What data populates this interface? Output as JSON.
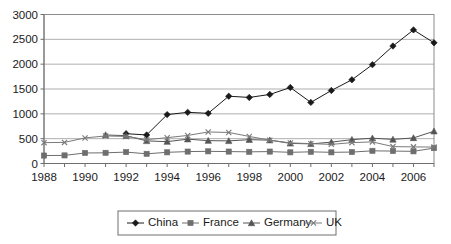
{
  "chart_data": {
    "type": "line",
    "title": "",
    "xlabel": "",
    "ylabel": "",
    "x": [
      1988,
      1989,
      1990,
      1991,
      1992,
      1993,
      1994,
      1995,
      1996,
      1997,
      1998,
      1999,
      2000,
      2001,
      2002,
      2003,
      2004,
      2005,
      2006,
      2007
    ],
    "xtick_labels": [
      "1988",
      "1990",
      "1992",
      "1994",
      "1996",
      "1998",
      "2000",
      "2002",
      "2004",
      "2006"
    ],
    "xticks": [
      1988,
      1990,
      1992,
      1994,
      1996,
      1998,
      2000,
      2002,
      2004,
      2006
    ],
    "ytick_labels": [
      "0",
      "500",
      "1000",
      "1500",
      "2000",
      "2500",
      "3000"
    ],
    "yticks": [
      0,
      500,
      1000,
      1500,
      2000,
      2500,
      3000
    ],
    "ylim": [
      0,
      3000
    ],
    "xlim": [
      1988,
      2007
    ],
    "grid": true,
    "legend_position": "bottom",
    "series": [
      {
        "name": "China",
        "marker": "diamond",
        "color": "#1a1a1a",
        "values": [
          null,
          null,
          null,
          null,
          600,
          575,
          985,
          1030,
          1010,
          1355,
          1330,
          1390,
          1530,
          1230,
          1470,
          1685,
          1990,
          2365,
          2690,
          2430
        ]
      },
      {
        "name": "France",
        "marker": "square",
        "color": "#6e6e6e",
        "values": [
          160,
          163,
          212,
          215,
          230,
          195,
          225,
          240,
          245,
          240,
          235,
          240,
          225,
          235,
          225,
          230,
          255,
          250,
          245,
          310
        ]
      },
      {
        "name": "Germany",
        "marker": "triangle",
        "color": "#555555",
        "values": [
          null,
          null,
          null,
          575,
          560,
          455,
          440,
          490,
          460,
          455,
          480,
          470,
          405,
          395,
          430,
          480,
          510,
          485,
          515,
          650
        ]
      },
      {
        "name": "UK",
        "marker": "x",
        "color": "#7a7a7a",
        "values": [
          420,
          425,
          515,
          555,
          545,
          480,
          520,
          565,
          635,
          625,
          545,
          470,
          415,
          400,
          385,
          420,
          435,
          340,
          335,
          330
        ]
      }
    ]
  },
  "legend": {
    "items": [
      {
        "label": "China",
        "marker": "diamond"
      },
      {
        "label": "France",
        "marker": "square"
      },
      {
        "label": "Germany",
        "marker": "triangle"
      },
      {
        "label": "UK",
        "marker": "x"
      }
    ]
  }
}
